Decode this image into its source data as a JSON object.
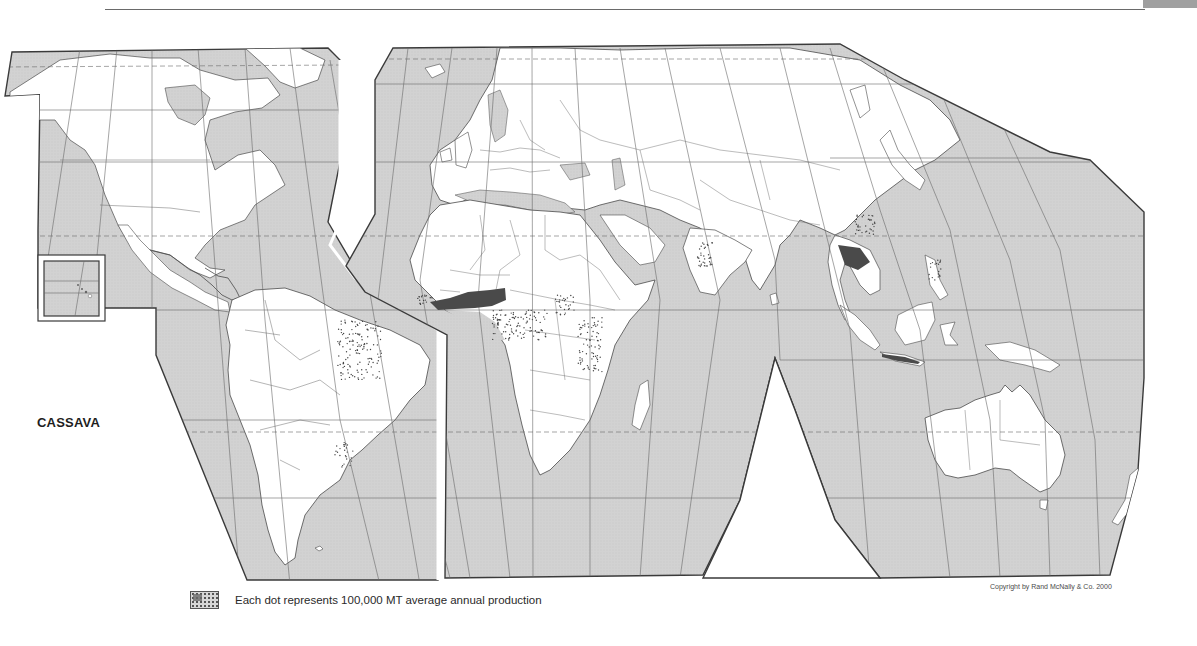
{
  "map": {
    "title": "CASSAVA",
    "legend": {
      "swatch_icon": "dot-pattern-swatch",
      "text": "Each dot represents 100,000 MT average annual production"
    },
    "copyright": "Copyright by Rand McNally & Co. 2000",
    "colors": {
      "ocean": "#d4d4d4",
      "land": "#ffffff",
      "outline": "#4a4a4a",
      "gridline": "#6e6e6e",
      "dots": "#3c3c3c",
      "background": "#ffffff"
    },
    "regions_with_production": [
      "Brazil (northeast)",
      "Paraguay / northern Argentina",
      "West Africa (Nigeria, Ghana, Ivory Coast)",
      "Central Africa (DR Congo, Angola)",
      "East Africa (Tanzania, Mozambique, Uganda)",
      "India (Kerala)",
      "Thailand / Southeast Asia",
      "Indonesia (Java)",
      "Philippines",
      "Southern China"
    ],
    "projection": "interrupted world map (Americas lobe / Eurasia-Africa-Oceania lobe)",
    "inset": "Hawaii inset box"
  }
}
